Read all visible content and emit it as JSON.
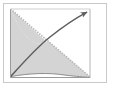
{
  "figure": {
    "name": "shaded-region-diagram",
    "width": 114,
    "height": 88,
    "background_color": "#ffffff",
    "outer_frame": {
      "label": "outer-frame",
      "x": 3,
      "y": 3,
      "width": 104,
      "height": 80,
      "stroke_color": "#c9c9c9",
      "stroke_width": 1,
      "fill": "#ffffff"
    },
    "plot_area": {
      "label": "plot-area",
      "x": 10.5,
      "y": 9,
      "width": 79.5,
      "height": 68,
      "fill": "#ffffff"
    },
    "axes": {
      "left_axis": {
        "label": "left-axis",
        "x1": 10.5,
        "y1": 9,
        "x2": 10.5,
        "y2": 77,
        "stroke_color": "#9a9a9a",
        "stroke_width": 1
      },
      "bottom_axis": {
        "label": "bottom-axis",
        "x1": 10.5,
        "y1": 77,
        "x2": 90,
        "y2": 77,
        "stroke_color": "#9a9a9a",
        "stroke_width": 1
      },
      "right_axis": {
        "label": "right-axis",
        "x1": 90,
        "y1": 9,
        "x2": 90,
        "y2": 77,
        "stroke_color": "#b4b4b4",
        "stroke_width": 1
      },
      "top_axis": {
        "label": "top-axis",
        "x1": 10.5,
        "y1": 9,
        "x2": 90,
        "y2": 9,
        "stroke_color": "#cfcfcf",
        "stroke_width": 1
      }
    },
    "shaded_region": {
      "label": "shaded-region",
      "fill_color": "#d4d4d4",
      "fill_opacity": 1,
      "description": "area enclosed between the descending diagonal line and the ascending concave curve"
    },
    "diagonal_line": {
      "label": "diagonal-line",
      "x1": 10.5,
      "y1": 9,
      "x2": 90,
      "y2": 77,
      "stroke_color": "#bdbdbd",
      "stroke_width": 1.6,
      "dash": "1.4 1.2"
    },
    "curve": {
      "label": "arrow-curve",
      "start": [
        11,
        76
      ],
      "control_1": [
        30,
        64
      ],
      "control_2": [
        62,
        36
      ],
      "end": [
        87,
        13
      ],
      "stroke_color": "#5e5e5e",
      "stroke_width": 1.5,
      "arrowhead": {
        "label": "arrowhead",
        "tip": [
          89.5,
          11
        ],
        "color": "#5e5e5e"
      }
    },
    "lower_curve": {
      "label": "lower-boundary-curve",
      "start": [
        11,
        76.5
      ],
      "control_1": [
        40,
        73
      ],
      "control_2": [
        66,
        76
      ],
      "end": [
        90,
        77
      ],
      "stroke_color": "#8c8c8c",
      "stroke_width": 1
    },
    "crossing_point": {
      "label": "curve-diagonal-intersection",
      "x": 47,
      "y": 42
    },
    "right_margin_panel": {
      "label": "right-white-panel",
      "x": 90,
      "y": 9,
      "width": 17,
      "height": 68,
      "fill": "#ffffff"
    }
  }
}
